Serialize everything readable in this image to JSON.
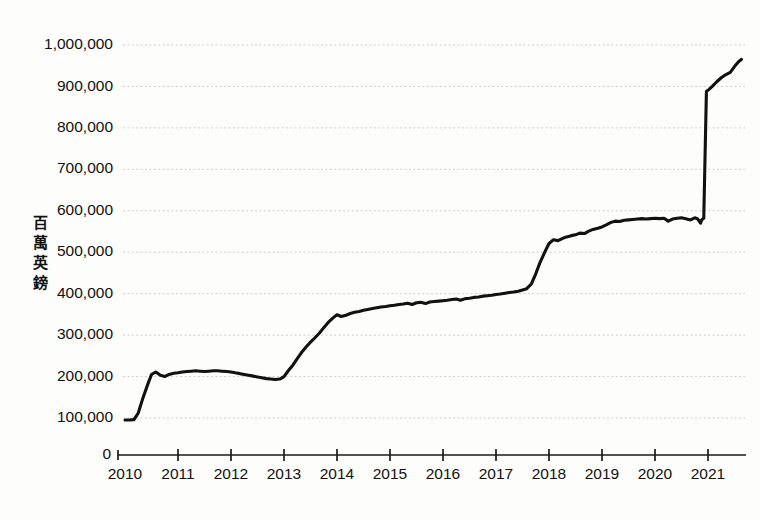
{
  "chart_data": {
    "type": "line",
    "title": "",
    "subtitle": "",
    "xlabel": "",
    "ylabel": "百萬英鎊",
    "ylabel_chars": [
      "百",
      "萬",
      "英",
      "鎊"
    ],
    "xlim": [
      2010.0,
      2021.75
    ],
    "ylim": [
      0,
      1040000
    ],
    "y_axis_origin_label": "0",
    "yticks": [
      100000,
      200000,
      300000,
      400000,
      500000,
      600000,
      700000,
      800000,
      900000,
      1000000
    ],
    "ytick_labels": [
      "100,000",
      "200,000",
      "300,000",
      "400,000",
      "500,000",
      "600,000",
      "700,000",
      "800,000",
      "900,000",
      "1,000,000"
    ],
    "xticks": [
      2010,
      2011,
      2012,
      2013,
      2014,
      2015,
      2016,
      2017,
      2018,
      2019,
      2020,
      2021
    ],
    "xtick_labels": [
      "2010",
      "2011",
      "2012",
      "2013",
      "2014",
      "2015",
      "2016",
      "2017",
      "2018",
      "2019",
      "2020",
      "2021"
    ],
    "grid": true,
    "grid_axis": "y",
    "grid_style": "dotted",
    "legend": false,
    "legend_position": "none",
    "line_color": "#111111",
    "grid_color": "#c8c8c8",
    "axis_color": "#1a1a1a",
    "background_color": "#fdfdfb",
    "series": [
      {
        "name": "百萬英鎊",
        "x": [
          2010.0,
          2010.08,
          2010.17,
          2010.25,
          2010.33,
          2010.42,
          2010.5,
          2010.58,
          2010.67,
          2010.75,
          2010.83,
          2010.92,
          2011.0,
          2011.08,
          2011.17,
          2011.25,
          2011.33,
          2011.42,
          2011.5,
          2011.58,
          2011.67,
          2011.75,
          2011.83,
          2011.92,
          2012.0,
          2012.08,
          2012.17,
          2012.25,
          2012.33,
          2012.42,
          2012.5,
          2012.58,
          2012.67,
          2012.75,
          2012.83,
          2012.92,
          2013.0,
          2013.08,
          2013.17,
          2013.25,
          2013.33,
          2013.42,
          2013.5,
          2013.58,
          2013.67,
          2013.75,
          2013.83,
          2013.92,
          2014.0,
          2014.08,
          2014.17,
          2014.25,
          2014.33,
          2014.42,
          2014.5,
          2014.58,
          2014.67,
          2014.75,
          2014.83,
          2014.92,
          2015.0,
          2015.08,
          2015.17,
          2015.25,
          2015.33,
          2015.42,
          2015.5,
          2015.58,
          2015.67,
          2015.75,
          2015.83,
          2015.92,
          2016.0,
          2016.08,
          2016.17,
          2016.25,
          2016.33,
          2016.42,
          2016.5,
          2016.58,
          2016.67,
          2016.75,
          2016.83,
          2016.92,
          2017.0,
          2017.08,
          2017.17,
          2017.25,
          2017.33,
          2017.42,
          2017.5,
          2017.58,
          2017.67,
          2017.75,
          2017.83,
          2017.92,
          2018.0,
          2018.08,
          2018.17,
          2018.25,
          2018.33,
          2018.42,
          2018.5,
          2018.58,
          2018.67,
          2018.75,
          2018.83,
          2018.92,
          2019.0,
          2019.08,
          2019.17,
          2019.25,
          2019.33,
          2019.42,
          2019.5,
          2019.58,
          2019.67,
          2019.75,
          2019.83,
          2019.92,
          2020.0,
          2020.08,
          2020.17,
          2020.25,
          2020.33,
          2020.42,
          2020.5,
          2020.58,
          2020.67,
          2020.75,
          2020.8,
          2020.84,
          2020.86,
          2020.88,
          2020.92,
          2020.97,
          2021.02,
          2021.08,
          2021.17,
          2021.25,
          2021.33,
          2021.42,
          2021.5,
          2021.58,
          2021.63
        ],
        "values": [
          95000,
          95000,
          96000,
          112000,
          145000,
          178000,
          205000,
          211000,
          203000,
          200000,
          205000,
          208000,
          209000,
          211000,
          212000,
          213000,
          214000,
          213000,
          212000,
          213000,
          214000,
          214000,
          213000,
          212000,
          211000,
          209000,
          207000,
          205000,
          203000,
          201000,
          199000,
          197000,
          195000,
          194000,
          193000,
          194000,
          200000,
          214000,
          228000,
          243000,
          258000,
          272000,
          283000,
          293000,
          305000,
          318000,
          330000,
          341000,
          349000,
          345000,
          348000,
          352000,
          355000,
          357000,
          360000,
          362000,
          364000,
          366000,
          368000,
          369000,
          371000,
          372000,
          374000,
          375000,
          377000,
          374000,
          378000,
          379000,
          376000,
          380000,
          381000,
          382000,
          383000,
          384000,
          386000,
          387000,
          384000,
          388000,
          389000,
          391000,
          392000,
          394000,
          395000,
          396000,
          398000,
          399000,
          401000,
          403000,
          404000,
          406000,
          409000,
          412000,
          424000,
          448000,
          475000,
          500000,
          521000,
          530000,
          528000,
          533000,
          537000,
          540000,
          542000,
          546000,
          545000,
          551000,
          555000,
          558000,
          561000,
          566000,
          572000,
          575000,
          574000,
          577000,
          578000,
          579000,
          580000,
          581000,
          580000,
          581000,
          582000,
          581000,
          582000,
          575000,
          580000,
          582000,
          583000,
          581000,
          578000,
          583000,
          581000,
          574000,
          570000,
          578000,
          582000,
          888000,
          893000,
          900000,
          912000,
          921000,
          928000,
          934000,
          948000,
          960000,
          965000
        ]
      }
    ],
    "annotations": []
  },
  "figure": {
    "axis_origin_label": "0"
  }
}
